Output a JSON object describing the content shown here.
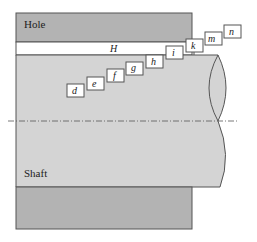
{
  "diagram": {
    "hole_label": "Hole",
    "shaft_label": "Shaft",
    "hole_deviation_label": "H",
    "shaft_deviation_labels": [
      "d",
      "e",
      "f",
      "g",
      "h",
      "i",
      "k",
      "m",
      "n"
    ],
    "colors": {
      "hole": "#b3b3b3",
      "shaft": "#d4d4d4",
      "gap": "#ffffff",
      "outline": "#555555"
    }
  }
}
